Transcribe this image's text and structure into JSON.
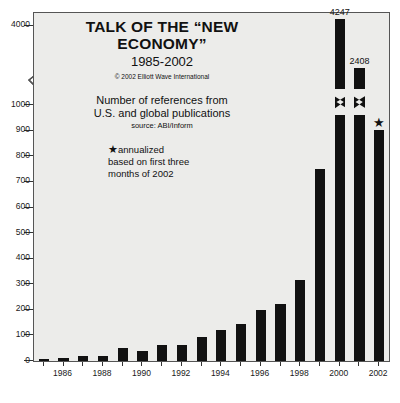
{
  "chart_data": {
    "type": "bar",
    "title": "TALK OF THE “NEW ECONOMY”",
    "subtitle": "1985-2002",
    "copyright": "© 2002 Elliott Wave International",
    "description_line1": "Number of references from",
    "description_line2": "U.S. and global publications",
    "source": "source: ABI/Inform",
    "note_line1": "annualized",
    "note_line2": "based on first three",
    "note_line3": "months of 2002",
    "note_marker": "★",
    "xlabel": "",
    "ylabel": "",
    "grid": false,
    "legend": false,
    "axis_break": true,
    "axis_break_between": [
      1000,
      4000
    ],
    "ylim": [
      0,
      4247
    ],
    "ytick_labels": [
      "0",
      "100",
      "200",
      "300",
      "400",
      "500",
      "600",
      "700",
      "800",
      "900",
      "1000",
      "4000"
    ],
    "yticks": [
      0,
      100,
      200,
      300,
      400,
      500,
      600,
      700,
      800,
      900,
      1000,
      4000
    ],
    "xtick_labels": [
      "1986",
      "1988",
      "1990",
      "1992",
      "1994",
      "1996",
      "1998",
      "2000",
      "2002"
    ],
    "categories": [
      "1985",
      "1986",
      "1987",
      "1988",
      "1989",
      "1990",
      "1991",
      "1992",
      "1993",
      "1994",
      "1995",
      "1996",
      "1997",
      "1998",
      "1999",
      "2000",
      "2001",
      "2002"
    ],
    "values": [
      8,
      11,
      18,
      21,
      52,
      41,
      63,
      63,
      95,
      123,
      145,
      201,
      224,
      316,
      752,
      4247,
      2408,
      905
    ],
    "data_labels": {
      "2000": "4247",
      "2001": "2408",
      "2002": "★"
    },
    "annualized_year": "2002"
  },
  "colors": {
    "bar": "#111111",
    "plot_background": "#ececea",
    "page_background": "#ffffff",
    "axis": "#555555",
    "text": "#111111"
  }
}
